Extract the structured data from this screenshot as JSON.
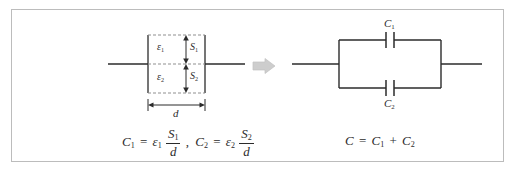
{
  "figure": {
    "border_color": "#bcbcbc",
    "background_color": "#ffffff",
    "ink_color": "#2b2b2b",
    "dashed_color": "#8f8f8f",
    "arrow_color": "#c9c9c9"
  },
  "left_diagram": {
    "name": "dielectric-capacitor",
    "labels": {
      "epsilon1": "ε",
      "epsilon1_sub": "1",
      "epsilon2": "ε",
      "epsilon2_sub": "2",
      "s1": "S",
      "s1_sub": "1",
      "s2": "S",
      "s2_sub": "2",
      "d": "d"
    }
  },
  "transition_arrow": {
    "name": "implies-arrow",
    "glyph": "⇒"
  },
  "right_diagram": {
    "name": "parallel-capacitor-circuit",
    "labels": {
      "c1": "C",
      "c1_sub": "1",
      "c2": "C",
      "c2_sub": "2"
    }
  },
  "equations": {
    "left": {
      "c1_lhs": "C",
      "c1_lhs_sub": "1",
      "equals": "=",
      "eps1": "ε",
      "eps1_sub": "1",
      "num1": "S",
      "num1_sub": "1",
      "den1": "d",
      "comma": ",",
      "c2_lhs": "C",
      "c2_lhs_sub": "2",
      "eps2": "ε",
      "eps2_sub": "2",
      "num2": "S",
      "num2_sub": "2",
      "den2": "d",
      "plain": "C1 = ε1 S1/d , C2 = ε2 S2/d"
    },
    "right": {
      "c_lhs": "C",
      "equals": "=",
      "c1": "C",
      "c1_sub": "1",
      "plus": "+",
      "c2": "C",
      "c2_sub": "2",
      "plain": "C = C1 + C2"
    }
  }
}
